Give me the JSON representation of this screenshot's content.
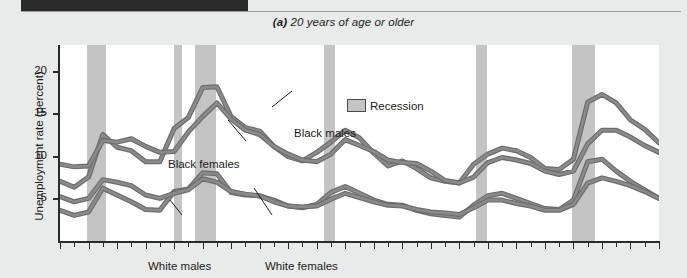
{
  "figure": {
    "title_lead": "(a)",
    "title_rest": " 20 years of age or older",
    "ylabel": "Unemployment rate (percent)"
  },
  "legend": {
    "recession_label": "Recession",
    "recession_color": "#c4c4c4"
  },
  "annotations": {
    "black_females": "Black females",
    "black_males": "Black males",
    "white_males": "White males",
    "white_females": "White females"
  },
  "ytick_labels": [
    "20",
    "15",
    "10",
    "5"
  ],
  "xtick_labels": [
    "1972",
    "1974",
    "1976",
    "1978",
    "1980",
    "1982",
    "1984",
    "1986",
    "1988",
    "1990",
    "1992",
    "1994",
    "1996",
    "1998",
    "2000",
    "2002",
    "2004",
    "2006",
    "2008",
    "2010",
    "2012",
    "2014"
  ],
  "chart_data": {
    "type": "line",
    "title": "(a) 20 years of age or older",
    "xlabel": "",
    "ylabel": "Unemployment rate (percent)",
    "xlim": [
      1972,
      2014
    ],
    "ylim": [
      0,
      23
    ],
    "yticks": [
      5,
      10,
      15,
      20
    ],
    "xticks": [
      1972,
      1974,
      1976,
      1978,
      1980,
      1982,
      1984,
      1986,
      1988,
      1990,
      1992,
      1994,
      1996,
      1998,
      2000,
      2002,
      2004,
      2006,
      2008,
      2010,
      2012,
      2014
    ],
    "grid": false,
    "legend_position": "top-center",
    "line_color": "#8a8a8a",
    "line_edge_color": "#6d6d6d",
    "recession_bands": [
      {
        "start": 1973.92,
        "end": 1975.25
      },
      {
        "start": 1980.0,
        "end": 1980.58
      },
      {
        "start": 1981.5,
        "end": 1982.92
      },
      {
        "start": 1990.5,
        "end": 1991.25
      },
      {
        "start": 2001.2,
        "end": 2001.92
      },
      {
        "start": 2007.92,
        "end": 2009.5
      }
    ],
    "x": [
      1972,
      1973,
      1974,
      1975,
      1976,
      1977,
      1978,
      1979,
      1980,
      1981,
      1982,
      1983,
      1984,
      1985,
      1986,
      1987,
      1988,
      1989,
      1990,
      1991,
      1992,
      1993,
      1994,
      1995,
      1996,
      1997,
      1998,
      1999,
      2000,
      2001,
      2002,
      2003,
      2004,
      2005,
      2006,
      2007,
      2008,
      2009,
      2010,
      2011,
      2012,
      2013,
      2014
    ],
    "series": [
      {
        "name": "Black males",
        "values": [
          7.0,
          6.3,
          7.5,
          12.5,
          11.0,
          10.6,
          9.3,
          9.3,
          13.2,
          14.5,
          18.0,
          18.1,
          14.6,
          13.3,
          12.9,
          11.1,
          9.9,
          9.4,
          10.4,
          11.6,
          13.0,
          12.1,
          10.3,
          8.8,
          9.4,
          8.5,
          7.4,
          7.0,
          6.8,
          9.0,
          10.2,
          10.9,
          10.6,
          9.8,
          8.5,
          8.4,
          9.6,
          16.3,
          17.2,
          16.2,
          14.2,
          13.1,
          11.5
        ]
      },
      {
        "name": "Black females",
        "values": [
          9.0,
          8.7,
          8.8,
          11.8,
          11.6,
          12.0,
          11.1,
          10.4,
          10.5,
          12.8,
          14.6,
          16.2,
          14.3,
          13.0,
          12.5,
          11.1,
          10.2,
          9.5,
          9.3,
          10.2,
          11.9,
          11.2,
          10.5,
          9.5,
          9.2,
          9.1,
          8.2,
          7.1,
          6.8,
          7.5,
          9.2,
          9.8,
          9.5,
          9.1,
          8.2,
          7.8,
          8.2,
          11.4,
          13.0,
          13.0,
          12.2,
          11.2,
          10.4
        ]
      },
      {
        "name": "White males",
        "values": [
          3.6,
          3.0,
          3.4,
          6.2,
          5.4,
          4.6,
          3.7,
          3.6,
          5.8,
          6.1,
          8.0,
          7.9,
          5.7,
          5.4,
          5.3,
          4.8,
          4.1,
          3.9,
          4.3,
          5.7,
          6.4,
          5.6,
          4.8,
          4.3,
          4.2,
          3.6,
          3.2,
          3.0,
          2.8,
          4.2,
          5.3,
          5.6,
          5.0,
          4.4,
          3.8,
          3.7,
          4.8,
          9.3,
          9.6,
          8.2,
          7.0,
          6.0,
          5.0
        ]
      },
      {
        "name": "White females",
        "values": [
          5.2,
          4.6,
          5.0,
          7.2,
          6.9,
          6.5,
          5.4,
          5.0,
          5.6,
          6.0,
          7.3,
          6.9,
          5.8,
          5.5,
          5.3,
          4.6,
          4.1,
          4.0,
          4.1,
          4.9,
          5.6,
          5.1,
          4.6,
          4.2,
          4.1,
          3.7,
          3.4,
          3.3,
          3.1,
          3.9,
          4.8,
          4.8,
          4.4,
          4.1,
          3.6,
          3.6,
          4.3,
          6.8,
          7.4,
          7.0,
          6.5,
          5.8,
          5.0
        ]
      }
    ]
  }
}
